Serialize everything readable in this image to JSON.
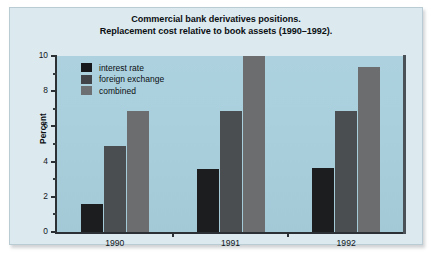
{
  "figure": {
    "title_line1": "Commercial bank derivatives positions.",
    "title_line2": "Replacement cost relative to book assets (1990–1992).",
    "page_background": "#dce9ef",
    "plot_background": "#a9cfdd",
    "axis_color": "#2a3034"
  },
  "chart_data": {
    "type": "bar",
    "title": "Commercial bank derivatives positions. Replacement cost relative to book assets (1990–1992).",
    "xlabel": "",
    "ylabel": "Percent",
    "categories": [
      "1990",
      "1991",
      "1992"
    ],
    "series": [
      {
        "name": "interest rate",
        "color": "#1b1d1f",
        "values": [
          1.6,
          3.6,
          3.65
        ]
      },
      {
        "name": "foreign exchange",
        "color": "#4b4e50",
        "values": [
          4.9,
          6.9,
          6.9
        ]
      },
      {
        "name": "combined",
        "color": "#6b6d6e",
        "values": [
          6.85,
          10.0,
          9.4
        ]
      }
    ],
    "ylim": [
      0,
      10
    ],
    "ytick_major": [
      0,
      2,
      4,
      6,
      8,
      10
    ],
    "ytick_minor": [
      1,
      3,
      5,
      7,
      9
    ],
    "ytick_labels": [
      "0",
      "2",
      "4",
      "6",
      "8",
      "10"
    ],
    "grid": false,
    "legend_position": "inside top-left",
    "annotations": []
  },
  "legend": {
    "items": [
      {
        "label": "interest rate"
      },
      {
        "label": "foreign exchange"
      },
      {
        "label": "combined"
      }
    ]
  }
}
